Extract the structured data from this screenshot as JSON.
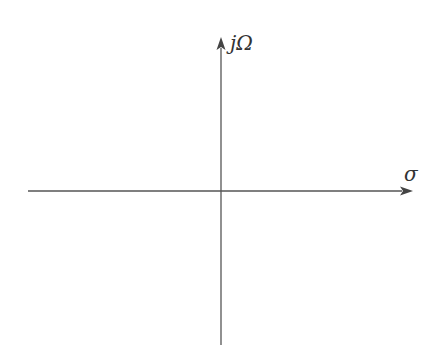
{
  "diagram": {
    "axes": {
      "vertical": {
        "label": "jΩ",
        "name": "imaginary-axis"
      },
      "horizontal": {
        "label": "σ",
        "name": "real-axis"
      }
    },
    "origin": {
      "x": 221,
      "y": 191
    },
    "colors": {
      "line": "#555555",
      "label": "#333333",
      "background": "#ffffff"
    }
  }
}
